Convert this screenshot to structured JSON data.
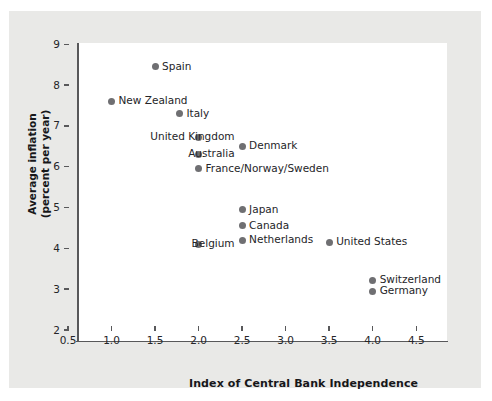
{
  "chart_data": {
    "type": "scatter",
    "title": "",
    "xlabel": "Index of Central Bank Independence",
    "ylabel": "Average inflation\n(percent per year)",
    "xlim": [
      0.5,
      4.75
    ],
    "ylim": [
      2,
      9.3
    ],
    "xticks": [
      "0.5",
      "1.0",
      "1.5",
      "2.0",
      "2.5",
      "3.0",
      "3.5",
      "4.0",
      "4.5"
    ],
    "xtick_values": [
      0.5,
      1.0,
      1.5,
      2.0,
      2.5,
      3.0,
      3.5,
      4.0,
      4.5
    ],
    "yticks": [
      "2",
      "3",
      "4",
      "5",
      "6",
      "7",
      "8",
      "9"
    ],
    "ytick_values": [
      2,
      3,
      4,
      5,
      6,
      7,
      8,
      9
    ],
    "grid": false,
    "legend": "none",
    "marker_color": "#6f6f72",
    "points": [
      {
        "label": "Spain",
        "x": 1.5,
        "y": 8.45,
        "label_side": "right"
      },
      {
        "label": "New Zealand",
        "x": 1.0,
        "y": 7.6,
        "label_side": "right"
      },
      {
        "label": "Italy",
        "x": 1.78,
        "y": 7.3,
        "label_side": "right"
      },
      {
        "label": "United Kingdom",
        "x": 2.0,
        "y": 6.72,
        "label_side": "left"
      },
      {
        "label": "Australia",
        "x": 2.0,
        "y": 6.3,
        "label_side": "left"
      },
      {
        "label": "Denmark",
        "x": 2.5,
        "y": 6.5,
        "label_side": "right"
      },
      {
        "label": "France/Norway/Sweden",
        "x": 2.0,
        "y": 5.95,
        "label_side": "right"
      },
      {
        "label": "Japan",
        "x": 2.5,
        "y": 4.95,
        "label_side": "right"
      },
      {
        "label": "Canada",
        "x": 2.5,
        "y": 4.55,
        "label_side": "right"
      },
      {
        "label": "Netherlands",
        "x": 2.5,
        "y": 4.2,
        "label_side": "right"
      },
      {
        "label": "Belgium",
        "x": 2.0,
        "y": 4.1,
        "label_side": "left"
      },
      {
        "label": "United States",
        "x": 3.5,
        "y": 4.15,
        "label_side": "right"
      },
      {
        "label": "Switzerland",
        "x": 4.0,
        "y": 3.22,
        "label_side": "right"
      },
      {
        "label": "Germany",
        "x": 4.0,
        "y": 2.95,
        "label_side": "right"
      }
    ]
  },
  "axes": {
    "x_title": "Index of Central Bank Independence",
    "y_title": "Average inflation\n(percent per year)"
  },
  "colors": {
    "panel_background": "#e9e9e7",
    "plot_background": "#ffffff",
    "axis": "#58585a",
    "marker": "#6f6f72",
    "text": "#252528"
  }
}
